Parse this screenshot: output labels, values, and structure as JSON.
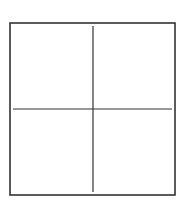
{
  "diagram": {
    "type": "quadrant-grid",
    "background": "#ffffff",
    "stroke_color": "#333333",
    "outer_box": {
      "x": 10,
      "y": 23,
      "width": 165,
      "height": 172,
      "stroke_width": 1.6
    },
    "vertical_divider": {
      "x": 93,
      "y1": 26,
      "y2": 192,
      "stroke_width": 1.2
    },
    "horizontal_divider": {
      "y": 109,
      "x1": 13,
      "x2": 172,
      "stroke_width": 1.2
    },
    "quadrants": [
      {
        "id": "top-left",
        "label": ""
      },
      {
        "id": "top-right",
        "label": ""
      },
      {
        "id": "bottom-left",
        "label": ""
      },
      {
        "id": "bottom-right",
        "label": ""
      }
    ]
  }
}
